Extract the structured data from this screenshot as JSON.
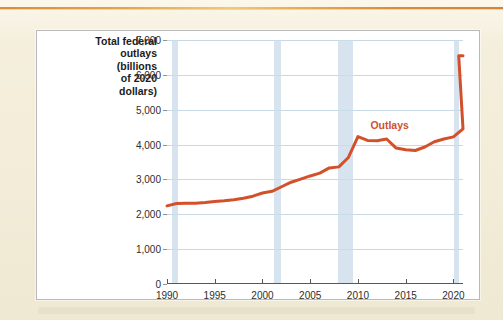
{
  "page": {
    "background_color": "#f4eedc",
    "top_rule_color": "#d9822b"
  },
  "chart_panel": {
    "background_color": "#ffffff",
    "border_color": "#b9b9b9"
  },
  "chart_data": {
    "type": "line",
    "title": "",
    "ylabel": "Total federal outlays (billions of 2020 dollars)",
    "ylabel_lines": [
      "Total federal",
      "outlays",
      "(billions",
      "of 2020",
      "dollars)"
    ],
    "xlabel": "",
    "xlim": [
      1990,
      2021
    ],
    "ylim": [
      0,
      7000
    ],
    "yticks": [
      0,
      1000,
      2000,
      3000,
      4000,
      5000,
      6000,
      7000
    ],
    "ytick_labels": [
      "0",
      "1,000",
      "2,000",
      "3,000",
      "4,000",
      "5,000",
      "6,000",
      "7,000"
    ],
    "xticks": [
      1990,
      1995,
      2000,
      2005,
      2010,
      2015,
      2020
    ],
    "xtick_labels": [
      "1990",
      "1995",
      "2000",
      "2005",
      "2010",
      "2015",
      "2020"
    ],
    "grid": true,
    "grid_color": "#c8d8e4",
    "legend": "none",
    "annotations": [
      {
        "text": "Outlays",
        "x": 2011.3,
        "y": 4720,
        "color": "#d2502a"
      }
    ],
    "shaded_regions": [
      {
        "name": "recession-1990-1991",
        "x0": 1990.5,
        "x1": 1991.2,
        "color": "#ccdcea"
      },
      {
        "name": "recession-2001",
        "x0": 2001.2,
        "x1": 2001.9,
        "color": "#ccdcea"
      },
      {
        "name": "recession-2008-2009",
        "x0": 2007.9,
        "x1": 2009.5,
        "color": "#ccdcea"
      },
      {
        "name": "recession-2020",
        "x0": 2020.1,
        "x1": 2020.6,
        "color": "#ccdcea"
      }
    ],
    "series": [
      {
        "name": "Outlays",
        "color": "#d2502a",
        "line_width": 3,
        "x": [
          1990,
          1991,
          1992,
          1993,
          1994,
          1995,
          1996,
          1997,
          1998,
          1999,
          2000,
          2001,
          2002,
          2003,
          2004,
          2005,
          2006,
          2007,
          2008,
          2009,
          2010,
          2011,
          2012,
          2013,
          2014,
          2015,
          2016,
          2017,
          2018,
          2019,
          2020,
          2021
        ],
        "values": [
          2240,
          2310,
          2320,
          2320,
          2340,
          2370,
          2390,
          2420,
          2460,
          2520,
          2610,
          2660,
          2790,
          2920,
          3010,
          3100,
          3180,
          3330,
          3360,
          3630,
          4230,
          4120,
          4110,
          4160,
          3900,
          3850,
          3830,
          3930,
          4080,
          4160,
          4220,
          4450
        ]
      }
    ],
    "series_tail_note": {
      "last_x": 2021,
      "last_y": 6550
    }
  }
}
